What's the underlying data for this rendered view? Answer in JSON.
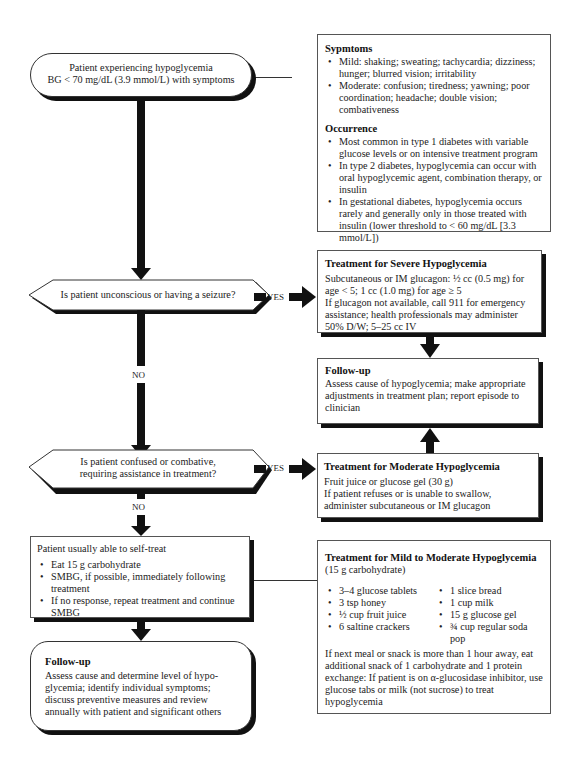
{
  "start": {
    "line1": "Patient experiencing hypoglycemia",
    "line2": "BG < 70 mg/dL (3.9 mmol/L) with symptoms"
  },
  "symptoms": {
    "title": "Sypmtoms",
    "items": [
      "Mild: shaking; sweating; tachycardia; dizziness; hunger; blurred vision; irritability",
      "Moderate: confusion; tiredness; yawning; poor coordination; headache; double vision; combativeness"
    ]
  },
  "occurrence": {
    "title": "Occurrence",
    "items": [
      "Most common in type 1 diabetes with variable glucose levels or on intensive treatment program",
      "In type 2 diabetes, hypoglycemia can occur with oral hypoglycemic agent, combination therapy, or insulin",
      "In gestational diabetes, hypoglycemia occurs rarely and generally only in those treated with insulin (lower threshold to < 60 mg/dL [3.3 mmol/L])"
    ]
  },
  "decision1": {
    "question": "Is patient unconscious or having a seizure?",
    "yes": "YES",
    "no": "NO"
  },
  "severe": {
    "title": "Treatment for Severe Hypoglycemia",
    "line1": "Subcutaneous or IM glucagon: ½ cc (0.5 mg) for age < 5; 1 cc (1.0 mg) for age ≥ 5",
    "line2": "If glucagon not available, call 911 for emergency assistance; health professionals may administer 50% D/W; 5–25 cc IV"
  },
  "followup_right": {
    "title": "Follow-up",
    "text": "Assess cause of hypoglycemia; make appropriate adjustments in treatment plan; report episode to clinician"
  },
  "decision2": {
    "line1": "Is patient confused or combative,",
    "line2": "requiring assistance in treatment?",
    "yes": "YES",
    "no": "NO"
  },
  "moderate": {
    "title": "Treatment for Moderate Hypoglycemia",
    "line1": "Fruit juice or glucose gel (30 g)",
    "line2": "If patient refuses or is unable to swallow, administer subcutaneous or IM glucagon"
  },
  "selftreat": {
    "heading": "Patient usually able to self-treat",
    "items": [
      "Eat 15 g carbohydrate",
      "SMBG, if possible, immediately following treatment",
      "If no response, repeat treatment and continue SMBG"
    ]
  },
  "followup_left": {
    "title": "Follow-up",
    "text": "Assess cause and determine level of hypo-glycemia; identify individual symptoms; discuss preventive measures and review annually with patient and significant others"
  },
  "mild": {
    "title": "Treatment for Mild to Moderate Hypoglycemia",
    "subtitle": "(15 g carbohydrate)",
    "col1": [
      "3–4 glucose tablets",
      "3 tsp honey",
      "½ cup fruit juice",
      "6 saltine crackers"
    ],
    "col2": [
      "1 slice bread",
      "1 cup milk",
      "15 g glucose gel",
      "¾ cup regular soda pop"
    ],
    "note": "If next meal or snack is more than 1 hour away, eat additional snack of 1 carbohydrate and 1 protein exchange: If patient is on α-glucosidase inhibitor, use glucose tabs or milk (not sucrose) to treat hypoglycemia"
  }
}
